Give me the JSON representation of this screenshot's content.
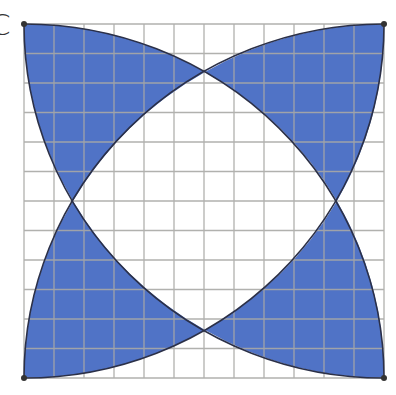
{
  "figure": {
    "label": "C",
    "grid": {
      "columns": 12,
      "rows": 12
    },
    "square": {
      "x": 24,
      "y": 24,
      "width": 360,
      "height": 354
    },
    "intersections": {
      "top": [
        205,
        72
      ],
      "left": [
        73,
        201
      ],
      "right": [
        337,
        201
      ],
      "bottom": [
        205,
        330
      ]
    },
    "colors": {
      "fill": "#5073c6",
      "grid": "#a9a9a6",
      "outline": "#2b3048",
      "corner_dot": "#333333",
      "background": "#ffffff"
    }
  }
}
